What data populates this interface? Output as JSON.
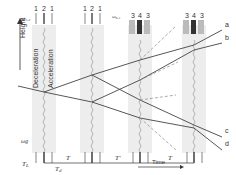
{
  "diagram": {
    "axes": {
      "y_label": "Height",
      "x_label": "Time"
    },
    "phase_labels": {
      "deceleration": "Deceleration",
      "acceleration": "Acceleration"
    },
    "pulse_groups": [
      {
        "id": "g1",
        "freq_label": "ω₁,₂",
        "beam_numbers": [
          "1",
          "2",
          "1"
        ]
      },
      {
        "id": "g2",
        "freq_label": "",
        "beam_numbers": [
          "1",
          "2",
          "1"
        ]
      },
      {
        "id": "g3",
        "freq_label": "ω₃,₄",
        "beam_numbers": [
          "3",
          "4",
          "3"
        ]
      },
      {
        "id": "g4",
        "freq_label": "",
        "beam_numbers": [
          "3",
          "4",
          "3"
        ]
      }
    ],
    "output_ports": [
      "a",
      "b",
      "c",
      "d"
    ],
    "timeline": {
      "omega_label": "ωg",
      "intervals": [
        "T",
        "T'",
        "T"
      ],
      "TL_label": "T",
      "TL_sub": "L",
      "Td_label": "T",
      "Td_sub": "d"
    },
    "colors": {
      "band": "#ececec",
      "line": "#444444",
      "dashed": "#888888"
    }
  }
}
